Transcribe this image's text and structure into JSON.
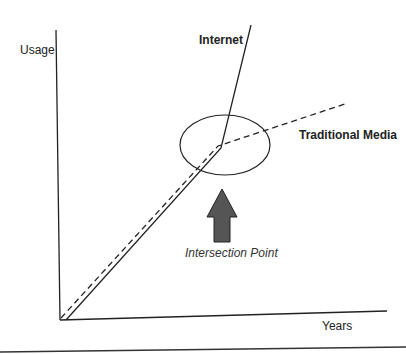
{
  "diagram": {
    "y_axis_label": "Usage",
    "x_axis_label": "Years",
    "series": [
      {
        "name": "Internet",
        "style": "solid"
      },
      {
        "name": "Traditional Media",
        "style": "dashed"
      }
    ],
    "annotation": "Intersection Point",
    "colors": {
      "line": "#222222",
      "arrow_fill": "#555555"
    }
  }
}
